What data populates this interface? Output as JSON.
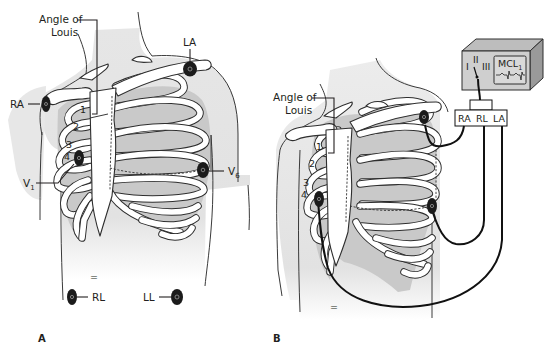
{
  "figure": {
    "type": "anatomical-diagram",
    "panels": [
      {
        "id": "A",
        "label": "A",
        "labels": {
          "angle_of_louis": "Angle of\nLouis",
          "angle_line1": "Angle of",
          "angle_line2": "Louis",
          "ra": "RA",
          "la": "LA",
          "v1": "V",
          "v1_sub": "1",
          "v6": "V",
          "v6_sub": "6",
          "rl": "RL",
          "ll": "LL"
        },
        "rib_numbers": [
          "1",
          "2",
          "3",
          "4"
        ],
        "electrodes": [
          "RA",
          "LA",
          "V1",
          "V6",
          "RL",
          "LL"
        ]
      },
      {
        "id": "B",
        "label": "B",
        "labels": {
          "angle_line1": "Angle of",
          "angle_line2": "Louis"
        },
        "rib_numbers": [
          "1",
          "2",
          "3",
          "4"
        ],
        "electrodes": [
          "left-shoulder",
          "V1",
          "V6"
        ],
        "monitor": {
          "lead_options": [
            "I",
            "II",
            "III"
          ],
          "selected_lead_label": "MCL",
          "selected_lead_sub": "1",
          "connector_labels": [
            "RA",
            "RL",
            "LA"
          ]
        }
      }
    ]
  }
}
